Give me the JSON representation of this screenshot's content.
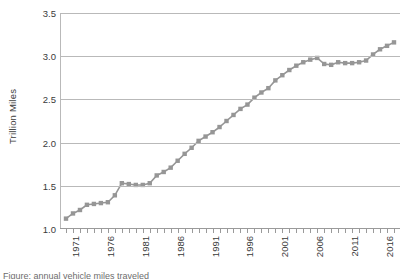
{
  "chart_data": {
    "type": "line",
    "title": "",
    "xlabel": "",
    "ylabel": "Trillion Miles",
    "ylim": [
      1.0,
      3.5
    ],
    "xlim": [
      1971,
      2018
    ],
    "grid": "horizontal",
    "legend": "none",
    "marker": "square",
    "series_color": "#969696",
    "grid_color": "#b9b9b9",
    "y_ticks": [
      "1.0",
      "1.5",
      "2.0",
      "2.5",
      "3.0",
      "3.5"
    ],
    "y_tick_values": [
      1.0,
      1.5,
      2.0,
      2.5,
      3.0,
      3.5
    ],
    "x_tick_labels": [
      "1971",
      "1976",
      "1981",
      "1986",
      "1991",
      "1996",
      "2001",
      "2006",
      "2011",
      "2016"
    ],
    "x_tick_label_values": [
      1971,
      1976,
      1981,
      1986,
      1991,
      1996,
      2001,
      2006,
      2011,
      2016
    ],
    "x": [
      1971,
      1972,
      1973,
      1974,
      1975,
      1976,
      1977,
      1978,
      1979,
      1980,
      1981,
      1982,
      1983,
      1984,
      1985,
      1986,
      1987,
      1988,
      1989,
      1990,
      1991,
      1992,
      1993,
      1994,
      1995,
      1996,
      1997,
      1998,
      1999,
      2000,
      2001,
      2002,
      2003,
      2004,
      2005,
      2006,
      2007,
      2008,
      2009,
      2010,
      2011,
      2012,
      2013,
      2014,
      2015,
      2016,
      2017,
      2018
    ],
    "values": [
      1.12,
      1.18,
      1.22,
      1.28,
      1.29,
      1.3,
      1.31,
      1.39,
      1.53,
      1.52,
      1.51,
      1.51,
      1.53,
      1.62,
      1.66,
      1.71,
      1.79,
      1.87,
      1.94,
      2.02,
      2.07,
      2.12,
      2.18,
      2.25,
      2.32,
      2.39,
      2.44,
      2.52,
      2.58,
      2.63,
      2.72,
      2.78,
      2.84,
      2.89,
      2.93,
      2.96,
      2.98,
      2.91,
      2.9,
      2.93,
      2.92,
      2.92,
      2.93,
      2.95,
      3.02,
      3.08,
      3.12,
      3.16
    ]
  },
  "caption": {
    "text": "Figure: annual vehicle miles traveled"
  }
}
